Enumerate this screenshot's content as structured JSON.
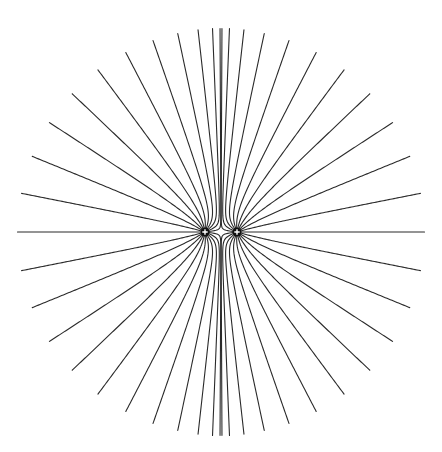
{
  "diagram": {
    "title": "",
    "description": "Electric field lines of two equal positive point charges",
    "colors": {
      "background": "#ffffff",
      "field_line": "#2a2a2a",
      "charge_fill": "#111111",
      "charge_sign": "#ffffff"
    },
    "charges": [
      {
        "id": "left",
        "sign": "+",
        "x": 205,
        "y": 232,
        "radius": 4.5
      },
      {
        "id": "right",
        "sign": "+",
        "x": 237,
        "y": 232,
        "radius": 4.5
      }
    ],
    "lines_per_charge": 23,
    "boundary": {
      "cx": 221,
      "cy": 232,
      "r": 203
    },
    "total_field_lines": 46
  }
}
